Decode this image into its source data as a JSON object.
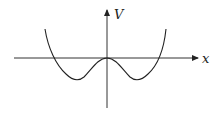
{
  "diagram": {
    "type": "potential-energy-curve",
    "axes": {
      "x_label": "x",
      "y_label": "V"
    },
    "colors": {
      "stroke": "#222222",
      "background": "#ffffff"
    }
  }
}
